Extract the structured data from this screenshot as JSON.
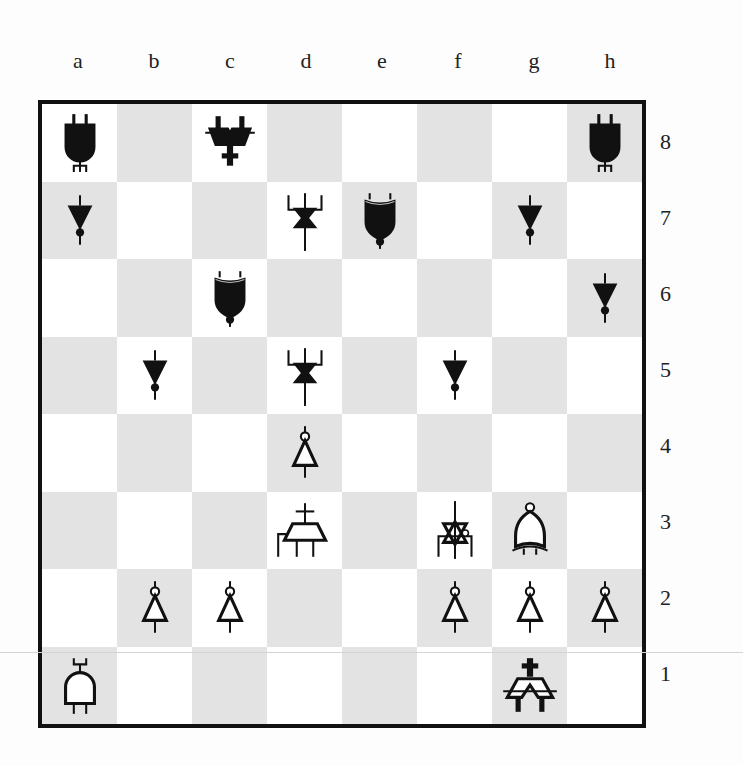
{
  "board": {
    "files": [
      "a",
      "b",
      "c",
      "d",
      "e",
      "f",
      "g",
      "h"
    ],
    "ranks": [
      "8",
      "7",
      "6",
      "5",
      "4",
      "3",
      "2",
      "1"
    ],
    "colors": {
      "light": "#ffffff",
      "dark": "#e3e3e3",
      "border": "#111111",
      "black_piece": "#111111",
      "white_piece": "#ffffff"
    },
    "pieces": [
      {
        "square": "a8",
        "color": "black",
        "type": "rook",
        "glyph": "and-gate"
      },
      {
        "square": "c8",
        "color": "black",
        "type": "king",
        "glyph": "cross-mux"
      },
      {
        "square": "h8",
        "color": "black",
        "type": "rook",
        "glyph": "and-gate"
      },
      {
        "square": "a7",
        "color": "black",
        "type": "pawn",
        "glyph": "buffer-triangle"
      },
      {
        "square": "d7",
        "color": "black",
        "type": "queen",
        "glyph": "bowtie"
      },
      {
        "square": "e7",
        "color": "black",
        "type": "knight",
        "glyph": "shield"
      },
      {
        "square": "g7",
        "color": "black",
        "type": "pawn",
        "glyph": "buffer-triangle"
      },
      {
        "square": "c6",
        "color": "black",
        "type": "knight",
        "glyph": "shield"
      },
      {
        "square": "h6",
        "color": "black",
        "type": "pawn",
        "glyph": "buffer-triangle"
      },
      {
        "square": "b5",
        "color": "black",
        "type": "pawn",
        "glyph": "buffer-triangle"
      },
      {
        "square": "d5",
        "color": "black",
        "type": "queen",
        "glyph": "bowtie"
      },
      {
        "square": "f5",
        "color": "black",
        "type": "pawn",
        "glyph": "buffer-triangle"
      },
      {
        "square": "d4",
        "color": "white",
        "type": "pawn",
        "glyph": "inverter-triangle"
      },
      {
        "square": "d3",
        "color": "white",
        "type": "bishop",
        "glyph": "trapezoid-cross"
      },
      {
        "square": "f3",
        "color": "white",
        "type": "queen",
        "glyph": "bowtie"
      },
      {
        "square": "g3",
        "color": "white",
        "type": "knight",
        "glyph": "bell"
      },
      {
        "square": "b2",
        "color": "white",
        "type": "pawn",
        "glyph": "inverter-triangle"
      },
      {
        "square": "c2",
        "color": "white",
        "type": "pawn",
        "glyph": "inverter-triangle"
      },
      {
        "square": "f2",
        "color": "white",
        "type": "pawn",
        "glyph": "inverter-triangle"
      },
      {
        "square": "g2",
        "color": "white",
        "type": "pawn",
        "glyph": "inverter-triangle"
      },
      {
        "square": "h2",
        "color": "white",
        "type": "pawn",
        "glyph": "inverter-triangle"
      },
      {
        "square": "a1",
        "color": "white",
        "type": "rook",
        "glyph": "and-gate"
      },
      {
        "square": "g1",
        "color": "white",
        "type": "king",
        "glyph": "cross-mux"
      }
    ]
  }
}
